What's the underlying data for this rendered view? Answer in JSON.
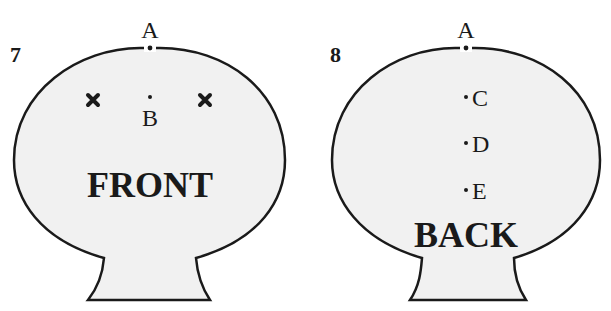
{
  "figures": [
    {
      "number": "7",
      "view": "FRONT",
      "top_point": "A",
      "points": [
        {
          "label": "B"
        }
      ],
      "markers": [
        "cross-left",
        "cross-right"
      ]
    },
    {
      "number": "8",
      "view": "BACK",
      "top_point": "A",
      "points": [
        {
          "label": "C"
        },
        {
          "label": "D"
        },
        {
          "label": "E"
        }
      ]
    }
  ],
  "colors": {
    "fill": "#f1f1f1",
    "stroke": "#1a1a1a",
    "background": "#ffffff"
  }
}
